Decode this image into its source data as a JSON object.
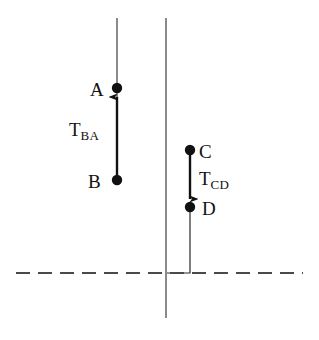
{
  "figure": {
    "type": "spacetime-worldline-diagram",
    "background_color": "#ffffff",
    "ink_color": "#111111",
    "caption": ""
  },
  "labels": {
    "event_a": "A",
    "event_b": "B",
    "event_c": "C",
    "event_d": "D",
    "interval_ba_symbol": "T",
    "interval_ba_subscript": "BA",
    "interval_cd_symbol": "T",
    "interval_cd_subscript": "CD"
  },
  "geometry": {
    "worldline_left_x": 117,
    "worldline_right_x": 166,
    "worldline_top_y": 18,
    "dashed_line_y": 273,
    "point_a": {
      "x": 117,
      "y": 88
    },
    "point_b": {
      "x": 117,
      "y": 180
    },
    "point_c": {
      "x": 190,
      "y": 150
    },
    "point_d": {
      "x": 190,
      "y": 207
    },
    "arrow_ba_direction": "up",
    "arrow_cd_direction": "down",
    "dash_pattern": "14 8"
  }
}
